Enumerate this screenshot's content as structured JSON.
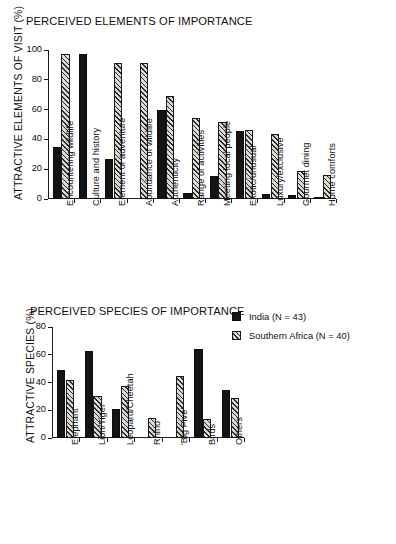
{
  "chart_data": [
    {
      "type": "bar",
      "title": "PERCEIVED ELEMENTS OF IMPORTANCE",
      "xlabel": "",
      "ylabel": "ATTRACTIVE ELEMENTS OF VISIT (%)",
      "ylim": [
        0,
        100
      ],
      "yticks": [
        0,
        20,
        40,
        60,
        80,
        100
      ],
      "grid": false,
      "legend_position": "right-middle",
      "categories": [
        "Encountering wildlife",
        "Culture and history",
        "Element of adventure",
        "Abundance of wildlife",
        "Authenticity",
        "Range of activities",
        "Meeting local people",
        "Exotic/unusual",
        "Luxury/exclusive",
        "Gourmet dining",
        "Home comforts"
      ],
      "series": [
        {
          "name": "India (N = 43)",
          "values": [
            35,
            97.5,
            27,
            0,
            60,
            4,
            15.5,
            45.5,
            3.5,
            3,
            1
          ]
        },
        {
          "name": "Southern Africa (N = 40)",
          "values": [
            97,
            0,
            91.5,
            91.5,
            69,
            54.5,
            51.5,
            46,
            43.5,
            18.5,
            16
          ]
        }
      ]
    },
    {
      "type": "bar",
      "title": "PERCEIVED SPECIES OF IMPORTANCE",
      "xlabel": "",
      "ylabel": "ATTRACTIVE SPECIES (%)",
      "ylim": [
        0,
        80
      ],
      "yticks": [
        0,
        20,
        40,
        60,
        80
      ],
      "grid": false,
      "legend_position": "right-top",
      "categories": [
        "Elephant",
        "Lion/Tiger",
        "Leopard/Cheetah",
        "Rhino",
        "'Big Five'",
        "Birds",
        "Others"
      ],
      "series": [
        {
          "name": "India (N = 43)",
          "values": [
            49,
            62.5,
            21,
            0,
            0,
            64.5,
            34.5
          ]
        },
        {
          "name": "Southern Africa (N = 40)",
          "values": [
            42,
            30,
            37.5,
            14.5,
            44.5,
            14,
            29
          ]
        }
      ]
    }
  ],
  "legend": {
    "items": [
      {
        "label": "India (N = 43)",
        "swatch": "solid-black-square",
        "color": "#141414"
      },
      {
        "label": "Southern Africa (N = 40)",
        "swatch": "diagonal-hatched-square",
        "color": "#d9d9d9"
      }
    ]
  },
  "colors": {
    "india": "#141414",
    "southern_africa_fill": "#d9d9d9",
    "southern_africa_hatch": "#2b2b2b",
    "axis": "#1a1a1a",
    "text": "#111111",
    "background": "#ffffff"
  }
}
